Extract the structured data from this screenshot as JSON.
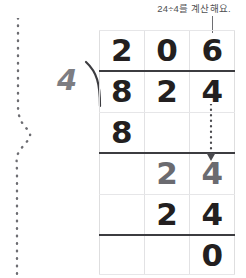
{
  "annotation": {
    "text": "24÷4를 계산해요.",
    "leader_icon": "vertical-leader-line"
  },
  "problem": {
    "dividend": "824",
    "divisor": "4",
    "quotient": "206",
    "expression": "824 ÷ 4 = 206"
  },
  "division": {
    "divisor_label": "4",
    "bracket_icon": "division-bracket",
    "rows": [
      {
        "name": "quotient",
        "digits": [
          "2",
          "0",
          "6"
        ],
        "ink": [
          "dark",
          "dark",
          "dark"
        ]
      },
      {
        "name": "dividend",
        "digits": [
          "8",
          "2",
          "4"
        ],
        "ink": [
          "dark",
          "dark",
          "dark"
        ]
      },
      {
        "name": "first-product",
        "digits": [
          "8",
          "",
          ""
        ],
        "ink": [
          "dark",
          "",
          ""
        ]
      },
      {
        "name": "first-remainder",
        "digits": [
          "",
          "2",
          "4"
        ],
        "ink": [
          "",
          "gray",
          "gray"
        ]
      },
      {
        "name": "second-product",
        "digits": [
          "",
          "2",
          "4"
        ],
        "ink": [
          "",
          "dark",
          "dark"
        ]
      },
      {
        "name": "final-remainder",
        "digits": [
          "",
          "",
          "0"
        ],
        "ink": [
          "",
          "",
          "dark"
        ]
      }
    ]
  },
  "decorations": {
    "tear_line_icon": "dotted-fold-line",
    "bringdown_arrow_icon": "dotted-down-arrow"
  },
  "colors": {
    "ink_dark": "#231f20",
    "ink_gray": "#6b6b70",
    "rule": "#3c3c40",
    "grid_line": "#e2e2e4",
    "annotation_text": "#4f4f52"
  }
}
